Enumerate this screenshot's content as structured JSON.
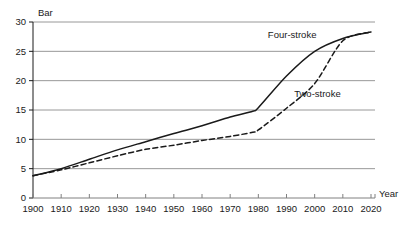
{
  "chart_data": {
    "type": "line",
    "title": "",
    "xlabel": "Year",
    "ylabel": "Bar",
    "xlim": [
      1900,
      2020
    ],
    "ylim": [
      0,
      30
    ],
    "grid": "horizontal",
    "legend_position": "inline-annotations",
    "x_ticks": [
      1900,
      1910,
      1920,
      1930,
      1940,
      1950,
      1960,
      1970,
      1980,
      1990,
      2000,
      2010,
      2020
    ],
    "y_ticks": [
      0,
      5,
      10,
      15,
      20,
      25,
      30
    ],
    "x": [
      1900,
      1910,
      1920,
      1930,
      1940,
      1950,
      1960,
      1970,
      1978,
      1980,
      1990,
      2000,
      2010,
      2020
    ],
    "series": [
      {
        "name": "Four-stroke",
        "style": "solid",
        "color": "#1a1a1a",
        "label_x": 1992,
        "label_y": 27.2,
        "values": [
          3.8,
          5.0,
          6.6,
          8.2,
          9.6,
          11.0,
          12.3,
          13.8,
          14.8,
          15.4,
          20.8,
          25.0,
          27.2,
          28.3
        ]
      },
      {
        "name": "Two-stroke",
        "style": "dashed",
        "color": "#1a1a1a",
        "label_x": 2001,
        "label_y": 17.3,
        "values": [
          3.8,
          4.8,
          6.0,
          7.2,
          8.3,
          9.0,
          9.8,
          10.5,
          11.2,
          11.6,
          15.3,
          19.5,
          26.8,
          28.3
        ]
      }
    ]
  },
  "axes": {
    "y_unit_label": "Bar",
    "x_unit_label": "Year"
  }
}
